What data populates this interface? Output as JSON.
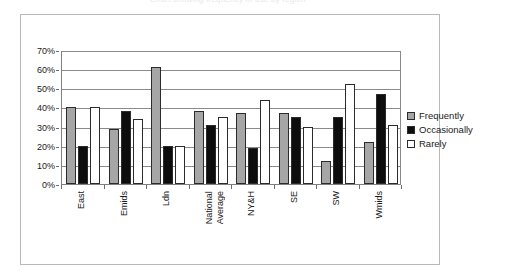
{
  "caption": {
    "text": "Chart showing frequency of use by region"
  },
  "legend": {
    "position": "right",
    "items": [
      {
        "label": "Frequently",
        "swatch": "frequently-swatch",
        "color": "#a6a6a6"
      },
      {
        "label": "Occasionally",
        "swatch": "occasionally-swatch",
        "color": "#0d0d0d"
      },
      {
        "label": "Rarely",
        "swatch": "rarely-swatch",
        "color": "#ffffff"
      }
    ]
  },
  "axis": {
    "y_ticks": [
      "0%",
      "10%",
      "20%",
      "30%",
      "40%",
      "50%",
      "60%",
      "70%"
    ]
  },
  "chart_data": {
    "type": "bar",
    "title": "",
    "xlabel": "",
    "ylabel": "",
    "ylim": [
      0,
      70
    ],
    "ytick_step": 10,
    "grid": true,
    "legend_position": "right",
    "categories": [
      "East",
      "Emids",
      "Ldn",
      "National\nAverage",
      "NY&H",
      "SE",
      "SW",
      "Wmids"
    ],
    "series": [
      {
        "name": "Frequently",
        "color": "#a6a6a6",
        "values": [
          40,
          29,
          61,
          38,
          37,
          37,
          12,
          22
        ]
      },
      {
        "name": "Occasionally",
        "color": "#0d0d0d",
        "values": [
          20,
          38,
          20,
          31,
          19,
          35,
          35,
          47
        ]
      },
      {
        "name": "Rarely",
        "color": "#ffffff",
        "values": [
          40,
          34,
          20,
          35,
          44,
          30,
          52,
          31
        ]
      }
    ]
  }
}
